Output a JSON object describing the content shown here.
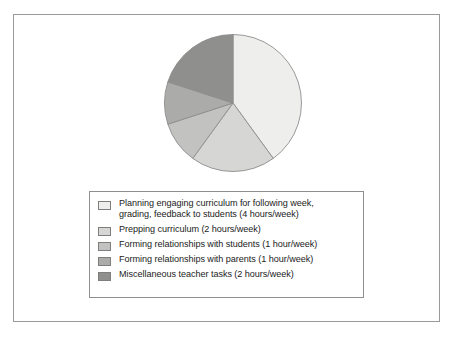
{
  "chart_data": {
    "type": "pie",
    "title": "",
    "subtitle": "",
    "xlabel": "",
    "ylabel": "",
    "units": "hours/week",
    "total": 10,
    "start_angle_deg": 0,
    "direction": "clockwise",
    "grid": false,
    "legend_position": "bottom",
    "categories": [
      "Planning engaging curriculum for following week, grading, feedback to students",
      "Prepping curriculum",
      "Forming relationships with students",
      "Forming relationships with parents",
      "Miscellaneous teacher tasks"
    ],
    "values": [
      4,
      2,
      1,
      1,
      2
    ],
    "angles_deg": [
      144,
      72,
      36,
      36,
      72
    ],
    "percentages": [
      40,
      20,
      10,
      10,
      20
    ],
    "colors": [
      "#eeeeec",
      "#d6d6d4",
      "#c2c2c0",
      "#ababa9",
      "#8f8f8d"
    ]
  },
  "legend": {
    "entries": [
      {
        "label": "Planning engaging curriculum for following week,\ngrading, feedback to students (4 hours/week)",
        "color": "#eeeeec"
      },
      {
        "label": "Prepping curriculum (2 hours/week)",
        "color": "#d6d6d4"
      },
      {
        "label": "Forming relationships with students (1 hour/week)",
        "color": "#c2c2c0"
      },
      {
        "label": "Forming relationships with parents (1 hour/week)",
        "color": "#ababa9"
      },
      {
        "label": "Miscellaneous teacher tasks (2 hours/week)",
        "color": "#8f8f8d"
      }
    ]
  }
}
